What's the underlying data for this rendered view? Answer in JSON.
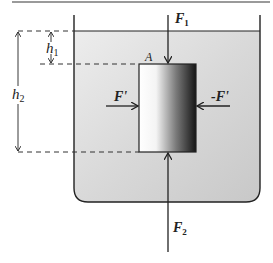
{
  "labels": {
    "F1": "F",
    "F1_sub": "1",
    "F2": "F",
    "F2_sub": "2",
    "F_prime": "F'",
    "neg_F_prime": "-F'",
    "A": "A",
    "h1": "h",
    "h1_sub": "1",
    "h2": "h",
    "h2_sub": "2"
  },
  "colors": {
    "line": "#222222",
    "liquid_light": "#f2f2f2",
    "liquid_dark": "#c4c4c4",
    "block_light": "#ffffff",
    "block_dark": "#1a1a1a",
    "top_rule": "#9a9a9a"
  }
}
